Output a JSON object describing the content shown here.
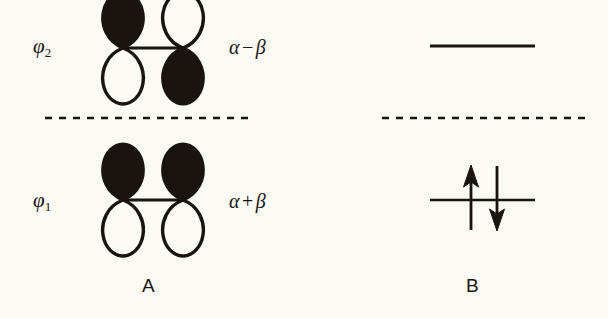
{
  "figure": {
    "background_color": "#fbfaf5",
    "ink_color": "#1a1410",
    "caption_a": "A",
    "caption_b": "B"
  },
  "panel_a": {
    "name": "orbital-diagram",
    "levels": [
      {
        "id": "antibonding",
        "mo_symbol": "φ",
        "mo_subscript": "2",
        "energy_alpha": "α",
        "energy_operator": "−",
        "energy_beta": "β",
        "orbital_type": "p-orbital-pair-antibonding",
        "left_lobe_filled": "top",
        "right_lobe_filled": "bottom",
        "y": 48
      },
      {
        "id": "bonding",
        "mo_symbol": "φ",
        "mo_subscript": "1",
        "energy_alpha": "α",
        "energy_operator": "+",
        "energy_beta": "β",
        "orbital_type": "p-orbital-pair-bonding",
        "left_lobe_filled": "top",
        "right_lobe_filled": "top",
        "y": 200
      }
    ],
    "reference_line": {
      "style": "dashed",
      "y": 118,
      "x_start": 45,
      "x_end": 250
    }
  },
  "panel_b": {
    "name": "energy-level-diagram",
    "levels": [
      {
        "id": "upper-level",
        "style": "solid",
        "y": 46,
        "x_start": 430,
        "x_end": 535,
        "electrons": []
      },
      {
        "id": "lower-level",
        "style": "solid",
        "y": 200,
        "x_start": 430,
        "x_end": 535,
        "electrons": [
          {
            "spin": "up",
            "direction": "↑"
          },
          {
            "spin": "down",
            "direction": "↓"
          }
        ]
      }
    ],
    "reference_line": {
      "style": "dashed",
      "y": 118,
      "x_start": 382,
      "x_end": 588
    }
  }
}
